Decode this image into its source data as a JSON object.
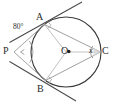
{
  "figure": {
    "kind": "circle-geometry-diagram",
    "points": {
      "A": "A",
      "B": "B",
      "C": "C",
      "O": "O",
      "P": "P"
    },
    "labels": {
      "angle_at_p": "80°",
      "angle_at_c": "x"
    },
    "icons": {
      "center_dot": "center-dot-icon",
      "right_angle_a": "right-angle-mark-icon",
      "right_angle_b": "right-angle-mark-icon",
      "arc_p": "angle-arc-icon",
      "arc_c": "angle-arc-icon"
    },
    "colors": {
      "stroke_dark": "#3a3a3a",
      "stroke_light": "#b9b9b9",
      "stroke_mid": "#8d8d8d",
      "text": "#2b2b2b",
      "background": "#ffffff"
    },
    "geometry": {
      "center": [
        66,
        52
      ],
      "radius": 35,
      "point_a": [
        44.5,
        24.5
      ],
      "point_b": [
        45.5,
        80.5
      ],
      "point_c": [
        100.5,
        52
      ],
      "point_p": [
        14,
        52
      ]
    }
  }
}
